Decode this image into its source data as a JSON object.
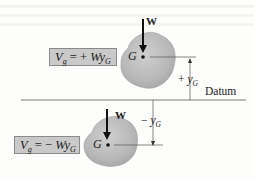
{
  "figure": {
    "upper_case": {
      "formula": {
        "lhs": "V",
        "lhs_sub": "g",
        "eq": " = + ",
        "rhs": "Wy",
        "rhs_sub": "G"
      },
      "weight_label": "W",
      "center_label": "G",
      "height_label": {
        "sign": "+ ",
        "var": "y",
        "sub": "G"
      }
    },
    "datum_label": "Datum",
    "lower_case": {
      "formula": {
        "lhs": "V",
        "lhs_sub": "g",
        "eq": " = − ",
        "rhs": "Wy",
        "rhs_sub": "G"
      },
      "weight_label": "W",
      "center_label": "G",
      "height_label": {
        "sign": "− ",
        "var": "y",
        "sub": "G"
      }
    },
    "colors": {
      "body_fill": "#b9b9b9",
      "formula_box": "#c9c9c9",
      "lines": "#444444"
    }
  }
}
